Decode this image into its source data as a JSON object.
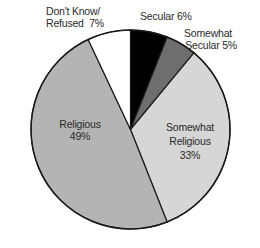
{
  "chart_data": {
    "type": "pie",
    "title": "",
    "start_angle_deg": 0,
    "direction": "clockwise",
    "slices": [
      {
        "label": "Secular",
        "value": 6,
        "display": "Secular 6%",
        "color": "#000000"
      },
      {
        "label": "Somewhat Secular",
        "value": 5,
        "display": "Somewhat Secular 5%",
        "color": "#6e6e6e"
      },
      {
        "label": "Somewhat Religious",
        "value": 33,
        "display": "Somewhat Religious 33%",
        "color": "#d6d6d6"
      },
      {
        "label": "Religious",
        "value": 49,
        "display": "Religious 49%",
        "color": "#b4b4b4"
      },
      {
        "label": "Don't Know/ Refused",
        "value": 7,
        "display": "Don't Know/ Refused 7%",
        "color": "#ffffff"
      }
    ],
    "legend": "none (labels placed on/near slices)",
    "outline_color": "#1a1a1a"
  },
  "labels": {
    "secular": {
      "line1": "Secular 6%"
    },
    "somewhat_secular": {
      "line1": "Somewhat",
      "line2": "Secular 5%"
    },
    "somewhat_religious": {
      "line1": "Somewhat",
      "line2": "Religious",
      "line3": "33%"
    },
    "religious": {
      "line1": "Religious",
      "line2": "49%"
    },
    "dont_know": {
      "line1": "Don't Know/",
      "line2": "Refused  7%"
    }
  }
}
